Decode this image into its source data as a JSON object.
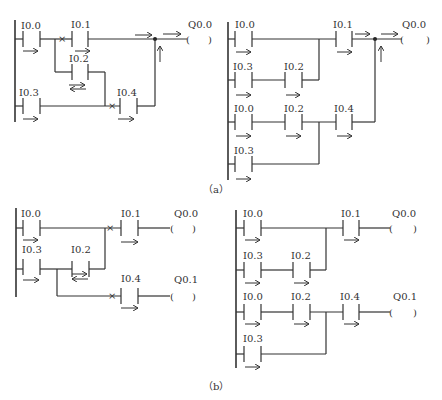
{
  "figure": {
    "caption_a": "（a）",
    "caption_b": "（b）"
  },
  "diagram_a_left": {
    "contacts": [
      "I0.0",
      "I0.1",
      "I0.2",
      "I0.3",
      "I0.4"
    ],
    "coil": "Q0.0"
  },
  "diagram_a_right": {
    "contacts": [
      "I0.0",
      "I0.1",
      "I0.3",
      "I0.2",
      "I0.0",
      "I0.2",
      "I0.4",
      "I0.3"
    ],
    "coil": "Q0.0"
  },
  "diagram_b_left": {
    "contacts": [
      "I0.0",
      "I0.1",
      "I0.3",
      "I0.2",
      "I0.4"
    ],
    "coils": [
      "Q0.0",
      "Q0.1"
    ]
  },
  "diagram_b_right": {
    "contacts": [
      "I0.0",
      "I0.1",
      "I0.3",
      "I0.2",
      "I0.0",
      "I0.2",
      "I0.4",
      "I0.3"
    ],
    "coils": [
      "Q0.0",
      "Q0.1"
    ]
  }
}
